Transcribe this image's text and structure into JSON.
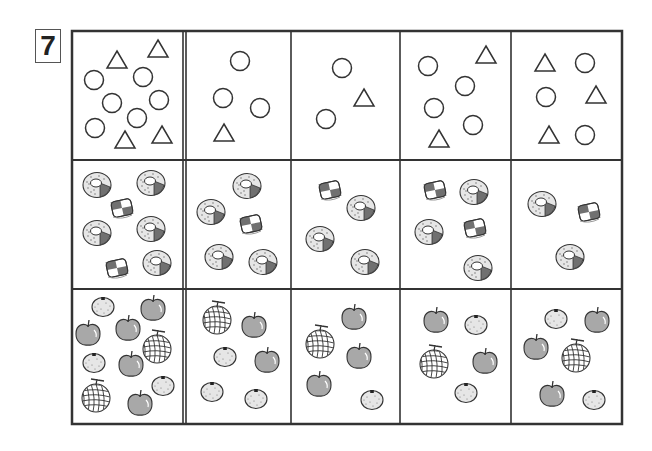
{
  "worksheet": {
    "problem_number": "7",
    "grid": {
      "left": 72,
      "top": 31,
      "right": 622,
      "bottom": 424,
      "column_lines": [
        183,
        186,
        291,
        400,
        511
      ],
      "row_lines": [
        160,
        289
      ],
      "line_color": "#333333"
    },
    "rows": [
      {
        "name": "shapes",
        "cells": [
          {
            "circles": 6,
            "triangles": 4
          },
          {
            "circles": 3,
            "triangles": 1
          },
          {
            "circles": 2,
            "triangles": 1
          },
          {
            "circles": 4,
            "triangles": 2
          },
          {
            "circles": 3,
            "triangles": 3
          }
        ]
      },
      {
        "name": "sweets",
        "cells": [
          {
            "donuts": 5,
            "candies": 2
          },
          {
            "donuts": 4,
            "candies": 1
          },
          {
            "donuts": 3,
            "candies": 1
          },
          {
            "donuts": 3,
            "candies": 2
          },
          {
            "donuts": 2,
            "candies": 1
          }
        ]
      },
      {
        "name": "fruits",
        "cells": [
          {
            "apples": 5,
            "oranges": 3,
            "melons": 2
          },
          {
            "apples": 2,
            "oranges": 3,
            "melons": 1
          },
          {
            "apples": 3,
            "oranges": 1,
            "melons": 1
          },
          {
            "apples": 2,
            "oranges": 2,
            "melons": 1
          },
          {
            "apples": 3,
            "oranges": 2,
            "melons": 1
          }
        ]
      }
    ],
    "items": [
      {
        "type": "triangle",
        "x": 117,
        "y": 60
      },
      {
        "type": "triangle",
        "x": 158,
        "y": 49
      },
      {
        "type": "triangle",
        "x": 125,
        "y": 140
      },
      {
        "type": "triangle",
        "x": 162,
        "y": 135
      },
      {
        "type": "circle",
        "x": 94,
        "y": 80
      },
      {
        "type": "circle",
        "x": 143,
        "y": 77
      },
      {
        "type": "circle",
        "x": 112,
        "y": 103
      },
      {
        "type": "circle",
        "x": 159,
        "y": 100
      },
      {
        "type": "circle",
        "x": 137,
        "y": 118
      },
      {
        "type": "circle",
        "x": 95,
        "y": 128
      },
      {
        "type": "circle",
        "x": 240,
        "y": 61
      },
      {
        "type": "circle",
        "x": 223,
        "y": 98
      },
      {
        "type": "circle",
        "x": 260,
        "y": 108
      },
      {
        "type": "triangle",
        "x": 224,
        "y": 133
      },
      {
        "type": "circle",
        "x": 342,
        "y": 68
      },
      {
        "type": "triangle",
        "x": 364,
        "y": 98
      },
      {
        "type": "circle",
        "x": 326,
        "y": 119
      },
      {
        "type": "circle",
        "x": 428,
        "y": 66
      },
      {
        "type": "circle",
        "x": 465,
        "y": 86
      },
      {
        "type": "circle",
        "x": 434,
        "y": 108
      },
      {
        "type": "circle",
        "x": 473,
        "y": 125
      },
      {
        "type": "triangle",
        "x": 486,
        "y": 55
      },
      {
        "type": "triangle",
        "x": 439,
        "y": 139
      },
      {
        "type": "triangle",
        "x": 545,
        "y": 63
      },
      {
        "type": "triangle",
        "x": 596,
        "y": 95
      },
      {
        "type": "triangle",
        "x": 549,
        "y": 135
      },
      {
        "type": "circle",
        "x": 585,
        "y": 63
      },
      {
        "type": "circle",
        "x": 546,
        "y": 97
      },
      {
        "type": "circle",
        "x": 585,
        "y": 135
      },
      {
        "type": "donut",
        "x": 97,
        "y": 185
      },
      {
        "type": "donut",
        "x": 151,
        "y": 183
      },
      {
        "type": "donut",
        "x": 97,
        "y": 233
      },
      {
        "type": "donut",
        "x": 151,
        "y": 229
      },
      {
        "type": "donut",
        "x": 157,
        "y": 263
      },
      {
        "type": "candy",
        "x": 122,
        "y": 208
      },
      {
        "type": "candy",
        "x": 117,
        "y": 268
      },
      {
        "type": "donut",
        "x": 247,
        "y": 186
      },
      {
        "type": "donut",
        "x": 211,
        "y": 212
      },
      {
        "type": "donut",
        "x": 219,
        "y": 257
      },
      {
        "type": "donut",
        "x": 263,
        "y": 262
      },
      {
        "type": "candy",
        "x": 251,
        "y": 224
      },
      {
        "type": "candy",
        "x": 330,
        "y": 190
      },
      {
        "type": "donut",
        "x": 361,
        "y": 208
      },
      {
        "type": "donut",
        "x": 320,
        "y": 239
      },
      {
        "type": "donut",
        "x": 365,
        "y": 262
      },
      {
        "type": "candy",
        "x": 435,
        "y": 190
      },
      {
        "type": "candy",
        "x": 475,
        "y": 228
      },
      {
        "type": "donut",
        "x": 474,
        "y": 192
      },
      {
        "type": "donut",
        "x": 429,
        "y": 232
      },
      {
        "type": "donut",
        "x": 478,
        "y": 268
      },
      {
        "type": "donut",
        "x": 542,
        "y": 204
      },
      {
        "type": "donut",
        "x": 570,
        "y": 257
      },
      {
        "type": "candy",
        "x": 589,
        "y": 212
      },
      {
        "type": "orange",
        "x": 103,
        "y": 307
      },
      {
        "type": "orange",
        "x": 94,
        "y": 363
      },
      {
        "type": "orange",
        "x": 163,
        "y": 386
      },
      {
        "type": "apple",
        "x": 153,
        "y": 309
      },
      {
        "type": "apple",
        "x": 88,
        "y": 334
      },
      {
        "type": "apple",
        "x": 128,
        "y": 329
      },
      {
        "type": "apple",
        "x": 131,
        "y": 365
      },
      {
        "type": "apple",
        "x": 140,
        "y": 404
      },
      {
        "type": "melon",
        "x": 157,
        "y": 349
      },
      {
        "type": "melon",
        "x": 96,
        "y": 398
      },
      {
        "type": "melon",
        "x": 217,
        "y": 320
      },
      {
        "type": "apple",
        "x": 254,
        "y": 326
      },
      {
        "type": "apple",
        "x": 267,
        "y": 361
      },
      {
        "type": "orange",
        "x": 225,
        "y": 357
      },
      {
        "type": "orange",
        "x": 212,
        "y": 392
      },
      {
        "type": "orange",
        "x": 256,
        "y": 399
      },
      {
        "type": "melon",
        "x": 320,
        "y": 344
      },
      {
        "type": "apple",
        "x": 354,
        "y": 318
      },
      {
        "type": "apple",
        "x": 359,
        "y": 357
      },
      {
        "type": "apple",
        "x": 319,
        "y": 385
      },
      {
        "type": "orange",
        "x": 372,
        "y": 400
      },
      {
        "type": "apple",
        "x": 436,
        "y": 321
      },
      {
        "type": "apple",
        "x": 485,
        "y": 362
      },
      {
        "type": "orange",
        "x": 476,
        "y": 325
      },
      {
        "type": "melon",
        "x": 434,
        "y": 364
      },
      {
        "type": "orange",
        "x": 466,
        "y": 393
      },
      {
        "type": "orange",
        "x": 556,
        "y": 319
      },
      {
        "type": "apple",
        "x": 597,
        "y": 321
      },
      {
        "type": "apple",
        "x": 536,
        "y": 348
      },
      {
        "type": "apple",
        "x": 552,
        "y": 395
      },
      {
        "type": "melon",
        "x": 576,
        "y": 358
      },
      {
        "type": "orange",
        "x": 594,
        "y": 400
      }
    ],
    "colors": {
      "stroke": "#333333",
      "fill_light": "#e6e6e6",
      "fill_gray": "#a8a8a8",
      "fill_dark": "#707070",
      "background": "#ffffff"
    }
  }
}
